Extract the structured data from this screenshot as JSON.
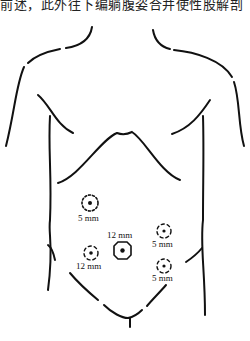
{
  "header": {
    "cropped_caption": "前述，此外往下编躺腹姿合并使性股解剖"
  },
  "figure": {
    "stroke_color": "#111111",
    "ports": [
      {
        "id": "left-upper",
        "size_label": "5 mm",
        "style": "dotted-circle"
      },
      {
        "id": "umbilical",
        "size_label": "12 mm",
        "style": "solid-octagon"
      },
      {
        "id": "left-lower",
        "size_label": "12 mm",
        "style": "dashed-crosshair"
      },
      {
        "id": "right-upper",
        "size_label": "5 mm",
        "style": "dashed-crosshair"
      },
      {
        "id": "right-lower",
        "size_label": "5 mm",
        "style": "dashed-crosshair"
      }
    ]
  }
}
